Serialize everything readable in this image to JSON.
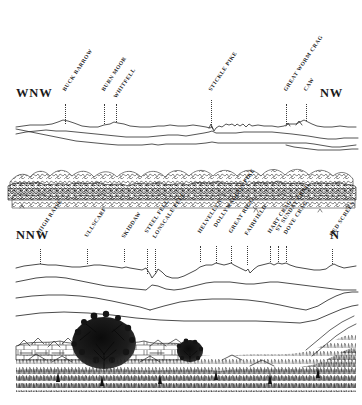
{
  "figure": {
    "kind": "panorama-skyline-diagram",
    "ink_color": "#1f1f1f",
    "background_color": "#ffffff",
    "panels": [
      {
        "id": "panel-top",
        "compass_left": "WNW",
        "compass_right": "NW",
        "peaks": [
          {
            "name": "BUCK BARROW",
            "leader_x": 65,
            "label_x": 66,
            "label_y": 86,
            "leader_top": 104,
            "leader_bottom": 124
          },
          {
            "name": "BURN MOOR",
            "leader_x": 104,
            "label_x": 105,
            "label_y": 86,
            "leader_top": 104,
            "leader_bottom": 124
          },
          {
            "name": "WHITFELL",
            "leader_x": 116,
            "label_x": 117,
            "label_y": 93,
            "leader_top": 104,
            "leader_bottom": 122
          },
          {
            "name": "STICKLE PIKE",
            "leader_x": 211,
            "label_x": 212,
            "label_y": 86,
            "leader_top": 100,
            "leader_bottom": 127
          },
          {
            "name": "GREAT WORM CRAG",
            "leader_x": 286,
            "label_x": 287,
            "label_y": 86,
            "leader_top": 104,
            "leader_bottom": 124
          },
          {
            "name": "CAW",
            "leader_x": 306,
            "label_x": 307,
            "label_y": 86,
            "leader_top": 104,
            "leader_bottom": 121
          }
        ]
      },
      {
        "id": "panel-mid",
        "compass_left": "",
        "compass_right": "",
        "peaks": []
      },
      {
        "id": "panel-bot",
        "compass_left": "NNW",
        "compass_right": "N",
        "peaks": [
          {
            "name": "HIGH RAISE",
            "leader_x": 40,
            "label_x": 41,
            "label_y": 228,
            "leader_top": 249,
            "leader_bottom": 264
          },
          {
            "name": "ULLSCARF",
            "leader_x": 87,
            "label_x": 88,
            "label_y": 232,
            "leader_top": 249,
            "leader_bottom": 264
          },
          {
            "name": "SKIDDAW",
            "leader_x": 124,
            "label_x": 125,
            "label_y": 233,
            "leader_top": 249,
            "leader_bottom": 262
          },
          {
            "name": "STEEL FELL",
            "leader_x": 147,
            "label_x": 148,
            "label_y": 228,
            "leader_top": 249,
            "leader_bottom": 274
          },
          {
            "name": "LONSCALE FELL",
            "leader_x": 155,
            "label_x": 156,
            "label_y": 233,
            "leader_top": 249,
            "leader_bottom": 274
          },
          {
            "name": "HELVELLYN",
            "leader_x": 200,
            "label_x": 201,
            "label_y": 228,
            "leader_top": 246,
            "leader_bottom": 262
          },
          {
            "name": "DOLLYWAGGON PIKE",
            "leader_x": 216,
            "label_x": 217,
            "label_y": 222,
            "leader_top": 246,
            "leader_bottom": 263
          },
          {
            "name": "GREAT RIGG",
            "leader_x": 231,
            "label_x": 232,
            "label_y": 228,
            "leader_top": 246,
            "leader_bottom": 263
          },
          {
            "name": "FAIRFIELD",
            "leader_x": 247,
            "label_x": 248,
            "label_y": 230,
            "leader_top": 246,
            "leader_bottom": 265
          },
          {
            "name": "HART CRAG",
            "leader_x": 270,
            "label_x": 271,
            "label_y": 228,
            "leader_top": 246,
            "leader_bottom": 262
          },
          {
            "name": "ST SUNDAY CRAG",
            "leader_x": 278,
            "label_x": 279,
            "label_y": 226,
            "leader_top": 246,
            "leader_bottom": 262
          },
          {
            "name": "DOVE CRAG",
            "leader_x": 286,
            "label_x": 287,
            "label_y": 229,
            "leader_top": 246,
            "leader_bottom": 262
          },
          {
            "name": "RED SCREES",
            "leader_x": 332,
            "label_x": 333,
            "label_y": 231,
            "leader_top": 249,
            "leader_bottom": 264
          }
        ]
      }
    ]
  }
}
